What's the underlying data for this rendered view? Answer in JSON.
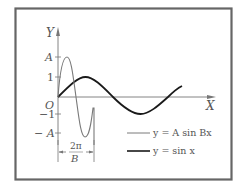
{
  "figure": {
    "axes": {
      "x_label": "X",
      "y_label": "Y",
      "origin_label": "O"
    },
    "y_ticks": [
      {
        "label": "A",
        "value": "A"
      },
      {
        "label": "1",
        "value": "1"
      },
      {
        "label": "−1",
        "value": "-1"
      },
      {
        "label": "− A",
        "value": "-A"
      }
    ],
    "period_annotation": {
      "numerator": "2π",
      "denominator": "B"
    },
    "legend": [
      {
        "label": "y = A sin Bx",
        "style": "thin",
        "color": "#7a7a7a"
      },
      {
        "label": "y = sin x",
        "style": "thick",
        "color": "#1a1a1a"
      }
    ],
    "colors": {
      "frame": "#666666",
      "axis": "#777777",
      "thin_curve": "#7a7a7a",
      "thick_curve": "#1a1a1a"
    }
  }
}
